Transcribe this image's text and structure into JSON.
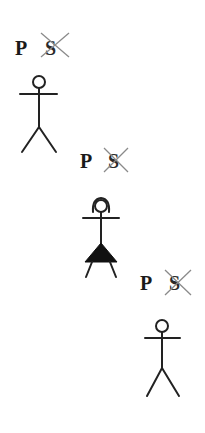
{
  "diagram": {
    "groups": [
      {
        "label_p": "P",
        "label_s": "S",
        "s_struck": true,
        "figure": "person",
        "p_x": 15,
        "p_y": 55,
        "s_x": 45,
        "s_y": 55,
        "strike": [
          41,
          33,
          69,
          57,
          41,
          57,
          69,
          33
        ],
        "head": [
          39,
          82,
          6
        ],
        "arms": [
          20,
          94,
          57,
          94
        ],
        "body": [
          39,
          88,
          39,
          127
        ],
        "legs": [
          22,
          152,
          39,
          127,
          56,
          152
        ],
        "skirt": null
      },
      {
        "label_p": "P",
        "label_s": "S",
        "s_struck": true,
        "figure": "person-skirt",
        "p_x": 80,
        "p_y": 168,
        "s_x": 108,
        "s_y": 168,
        "strike": [
          104,
          148,
          128,
          172,
          104,
          172,
          128,
          148
        ],
        "head": [
          101,
          206,
          6
        ],
        "arms": [
          83,
          218,
          119,
          218
        ],
        "body": [
          101,
          212,
          101,
          246
        ],
        "legs": [
          92,
          262,
          86,
          277,
          110,
          262,
          116,
          277
        ],
        "skirt": [
          101,
          243,
          85,
          262,
          117,
          262
        ]
      },
      {
        "label_p": "P",
        "label_s": "S",
        "s_struck": true,
        "figure": "person",
        "p_x": 140,
        "p_y": 290,
        "s_x": 169,
        "s_y": 290,
        "strike": [
          165,
          270,
          191,
          295,
          165,
          295,
          191,
          270
        ],
        "head": [
          162,
          326,
          6
        ],
        "arms": [
          145,
          338,
          180,
          338
        ],
        "body": [
          162,
          332,
          162,
          368
        ],
        "legs": [
          147,
          396,
          162,
          368,
          179,
          396
        ],
        "skirt": null
      }
    ],
    "colors": {
      "background": "#ffffff",
      "ink": "#222222",
      "strike": "#8a8a8a"
    }
  }
}
